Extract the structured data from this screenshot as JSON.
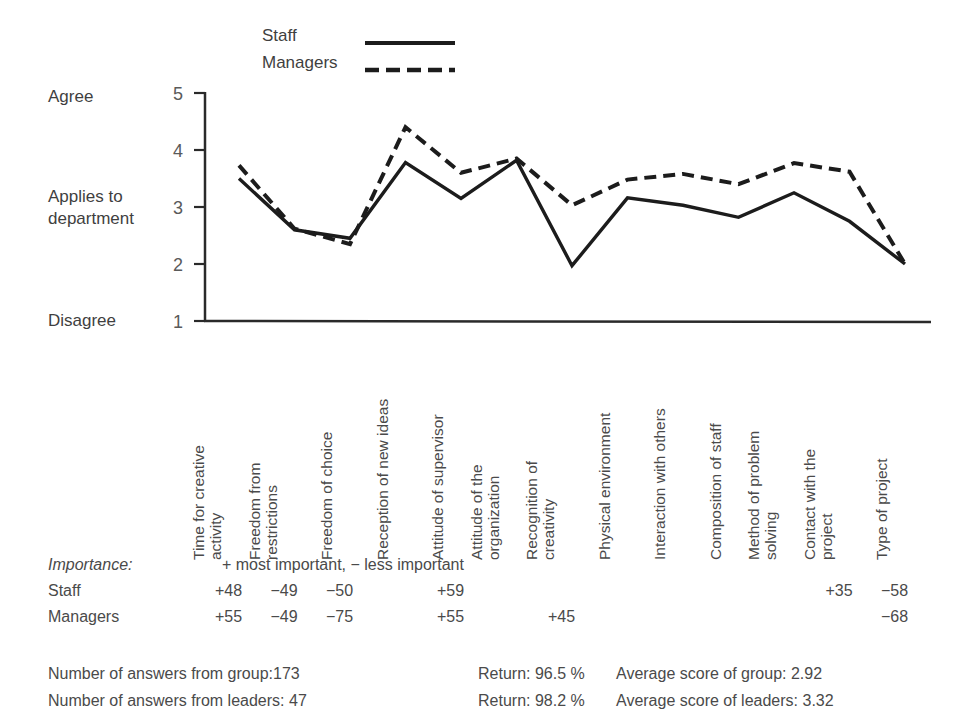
{
  "legend": {
    "items": [
      {
        "label": "Staff",
        "style": "solid"
      },
      {
        "label": "Managers",
        "style": "dashed"
      }
    ]
  },
  "axis": {
    "y_top_label": "Agree",
    "y_mid_label_line1": "Applies to",
    "y_mid_label_line2": "department",
    "y_bottom_label": "Disagree",
    "ticks": [
      "5",
      "4",
      "3",
      "2",
      "1"
    ]
  },
  "categories": [
    {
      "line1": "Time for creative",
      "line2": "activity"
    },
    {
      "line1": "Freedom from",
      "line2": "restrictions"
    },
    {
      "line1": "Freedom of choice",
      "line2": ""
    },
    {
      "line1": "Reception of new ideas",
      "line2": ""
    },
    {
      "line1": "Attitude of supervisor",
      "line2": ""
    },
    {
      "line1": "Attitude of the",
      "line2": "organization"
    },
    {
      "line1": "Recognition of",
      "line2": "creativity"
    },
    {
      "line1": "Physical environment",
      "line2": ""
    },
    {
      "line1": "Interaction with others",
      "line2": ""
    },
    {
      "line1": "Composition of staff",
      "line2": ""
    },
    {
      "line1": "Method of problem",
      "line2": "solving"
    },
    {
      "line1": "Contact with the",
      "line2": "project"
    },
    {
      "line1": "Type of project",
      "line2": ""
    }
  ],
  "importance": {
    "title": "Importance:",
    "note": "+ most important, − less important",
    "rows": [
      {
        "name": "Staff",
        "values": [
          "+48",
          "−49",
          "−50",
          "",
          "+59",
          "",
          "",
          "",
          "",
          "",
          "",
          "+35",
          "−58"
        ]
      },
      {
        "name": "Managers",
        "values": [
          "+55",
          "−49",
          "−75",
          "",
          "+55",
          "",
          "+45",
          "",
          "",
          "",
          "",
          "",
          "−68"
        ]
      }
    ]
  },
  "footer": {
    "rows": [
      {
        "count": "Number of answers from group:173",
        "return": "Return: 96.5 %",
        "average": "Average score of group: 2.92"
      },
      {
        "count": "Number of answers from leaders: 47",
        "return": "Return: 98.2 %",
        "average": "Average score of leaders: 3.32"
      }
    ]
  },
  "chart_data": {
    "type": "line",
    "title": "",
    "xlabel": "",
    "ylabel": "Applies to department",
    "ylim": [
      1,
      5
    ],
    "yticks": [
      1,
      2,
      3,
      4,
      5
    ],
    "grid": false,
    "legend_position": "top",
    "categories": [
      "Time for creative activity",
      "Freedom from restrictions",
      "Freedom of choice",
      "Reception of new ideas",
      "Attitude of supervisor",
      "Attitude of the organization",
      "Recognition of creativity",
      "Physical environment",
      "Interaction with others",
      "Composition of staff",
      "Method of problem solving",
      "Contact with the project",
      "Type of project"
    ],
    "series": [
      {
        "name": "Staff",
        "style": "solid",
        "values": [
          3.5,
          2.6,
          2.45,
          3.78,
          3.15,
          3.82,
          1.97,
          3.16,
          3.03,
          2.82,
          3.25,
          2.75,
          2.0
        ]
      },
      {
        "name": "Managers",
        "style": "dashed",
        "values": [
          3.73,
          2.62,
          2.35,
          4.4,
          3.6,
          3.85,
          3.03,
          3.48,
          3.58,
          3.4,
          3.77,
          3.62,
          2.0
        ]
      }
    ],
    "annotations": {
      "y_axis_anchors": [
        {
          "value": 5,
          "label": "Agree"
        },
        {
          "value": 3,
          "label": "Applies to department"
        },
        {
          "value": 1,
          "label": "Disagree"
        }
      ]
    }
  },
  "colors": {
    "line": "#1c1c1c",
    "text": "#4a4a4a",
    "axis": "#2a2a2a"
  }
}
